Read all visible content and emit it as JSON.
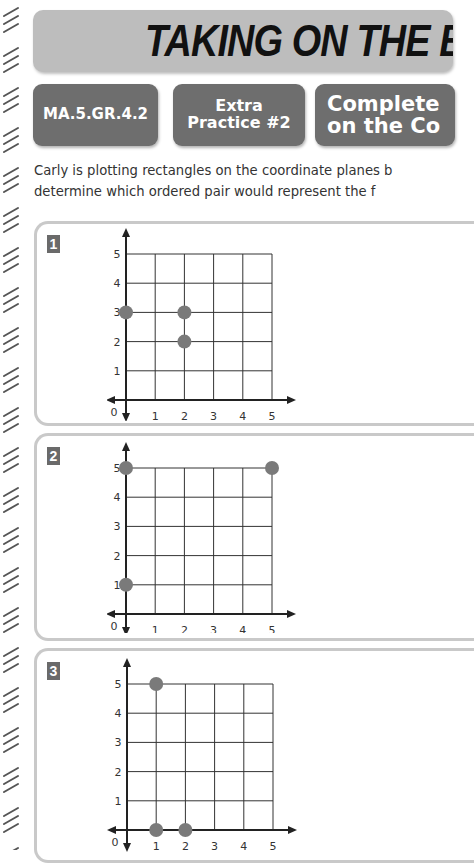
{
  "header": {
    "title": "TAKING ON THE B"
  },
  "tags": {
    "standard": "MA.5.GR.4.2",
    "practice_line1": "Extra",
    "practice_line2": "Practice #2",
    "topic_line1": "Complete",
    "topic_line2": "on the Co"
  },
  "instructions": {
    "line1": "Carly is plotting rectangles on the coordinate planes b",
    "line2": "determine which ordered pair would represent the f"
  },
  "problems": [
    {
      "number": "1",
      "points": [
        [
          0,
          3
        ],
        [
          2,
          3
        ],
        [
          2,
          2
        ]
      ]
    },
    {
      "number": "2",
      "points": [
        [
          0,
          5
        ],
        [
          5,
          5
        ],
        [
          0,
          1
        ]
      ]
    },
    {
      "number": "3",
      "points": [
        [
          1,
          5
        ],
        [
          1,
          0
        ],
        [
          2,
          0
        ]
      ]
    }
  ],
  "axis": {
    "origin_label": "0",
    "x_ticks": [
      "1",
      "2",
      "3",
      "4",
      "5"
    ],
    "y_ticks": [
      "1",
      "2",
      "3",
      "4",
      "5"
    ]
  },
  "colors": {
    "header_bg": "#bdbdbd",
    "tag_bg": "#6e6e6e",
    "point": "#7a7a7a",
    "grid": "#333333",
    "panel_border": "#c9c9c9"
  }
}
